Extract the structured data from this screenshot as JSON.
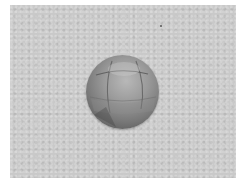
{
  "image": {
    "subject": "segmented sphere",
    "background": "gray textured backdrop",
    "colors": {
      "border": "#ffffff",
      "backdrop": "#c9c9c9",
      "sphere_light": "#b8b8b8",
      "sphere_dark": "#4a4a4a"
    }
  }
}
